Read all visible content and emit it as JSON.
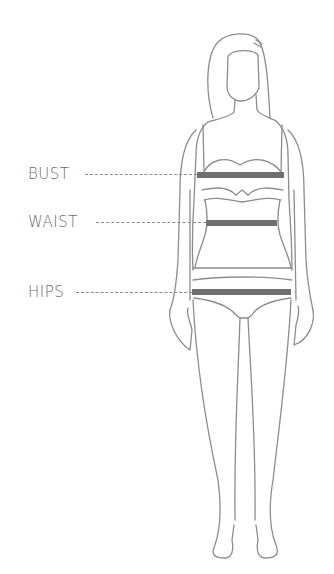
{
  "diagram": {
    "measurements": [
      {
        "label": "BUST",
        "color": "#6f6f6f"
      },
      {
        "label": "WAIST",
        "color": "#6f6f6f"
      },
      {
        "label": "HIPS",
        "color": "#6f6f6f"
      }
    ],
    "line_color": "#8a8a8a",
    "outline_color": "#8c8c8c"
  }
}
